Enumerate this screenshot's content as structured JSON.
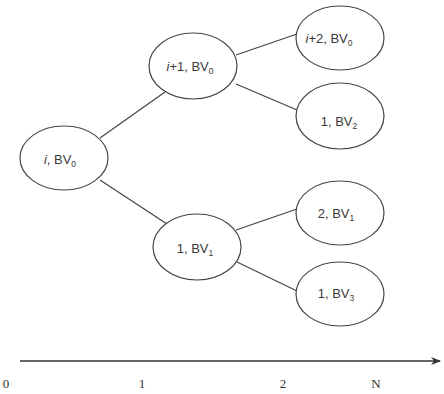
{
  "diagram": {
    "type": "tree",
    "nodes": [
      {
        "id": "root",
        "prefix_italic": "i",
        "prefix_rest": "",
        "label": "BV",
        "sub": "0",
        "cx": 64,
        "cy": 158
      },
      {
        "id": "n_i1",
        "prefix_italic": "i",
        "prefix_rest": "+1",
        "label": "BV",
        "sub": "0",
        "cx": 193,
        "cy": 66
      },
      {
        "id": "n_1bv1",
        "prefix_italic": "",
        "prefix_rest": "1",
        "label": "BV",
        "sub": "1",
        "cx": 197,
        "cy": 247
      },
      {
        "id": "n_i2",
        "prefix_italic": "i",
        "prefix_rest": "+2",
        "label": "BV",
        "sub": "0",
        "cx": 340,
        "cy": 38
      },
      {
        "id": "n_1bv2",
        "prefix_italic": "",
        "prefix_rest": "1",
        "label": "BV",
        "sub": "2",
        "cx": 340,
        "cy": 116
      },
      {
        "id": "n_2bv1",
        "prefix_italic": "",
        "prefix_rest": "2",
        "label": "BV",
        "sub": "1",
        "cx": 340,
        "cy": 213
      },
      {
        "id": "n_1bv3",
        "prefix_italic": "",
        "prefix_rest": "1",
        "label": "BV",
        "sub": "3",
        "cx": 340,
        "cy": 294
      }
    ],
    "edges": [
      {
        "from": "root",
        "to": "n_i1"
      },
      {
        "from": "root",
        "to": "n_1bv1"
      },
      {
        "from": "n_i1",
        "to": "n_i2"
      },
      {
        "from": "n_i1",
        "to": "n_1bv2"
      },
      {
        "from": "n_1bv1",
        "to": "n_2bv1"
      },
      {
        "from": "n_1bv1",
        "to": "n_1bv3"
      }
    ],
    "axis": {
      "ticks": [
        {
          "label": "0",
          "x": 6
        },
        {
          "label": "1",
          "x": 142
        },
        {
          "label": "2",
          "x": 283
        },
        {
          "label": "N",
          "x": 376
        }
      ]
    }
  },
  "labels": {
    "root": {
      "a": "i",
      "b": ", BV",
      "s": "0"
    },
    "n_i1": {
      "a": "i",
      "b": "+1, BV",
      "s": "0"
    },
    "n_1bv1": {
      "a": "",
      "b": "1, BV",
      "s": "1"
    },
    "n_i2": {
      "a": "i",
      "b": "+2, BV",
      "s": "0"
    },
    "n_1bv2": {
      "a": "",
      "b": "1, BV",
      "s": "2"
    },
    "n_2bv1": {
      "a": "",
      "b": "2, BV",
      "s": "1"
    },
    "n_1bv3": {
      "a": "",
      "b": "1, BV",
      "s": "3"
    }
  },
  "axis_labels": {
    "t0": "0",
    "t1": "1",
    "t2": "2",
    "tN": "N"
  }
}
